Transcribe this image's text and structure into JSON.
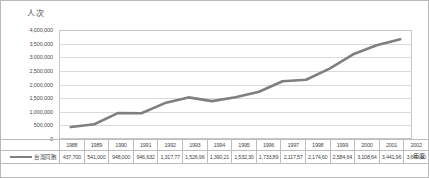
{
  "chart_data": {
    "type": "line",
    "title": "",
    "ylabel": "人次",
    "xlabel": "年度",
    "grid": true,
    "legend_position": "bottom-left",
    "ylim": [
      0,
      4000000
    ],
    "ytick_labels": [
      "4,000,000",
      "3,500,000",
      "3,000,000",
      "2,500,000",
      "2,000,000",
      "1,500,000",
      "1,000,000",
      "500,000",
      "0"
    ],
    "ytick_values": [
      4000000,
      3500000,
      3000000,
      2500000,
      2000000,
      1500000,
      1000000,
      500000,
      0
    ],
    "categories": [
      "1988",
      "1989",
      "1990",
      "1991",
      "1992",
      "1993",
      "1994",
      "1995",
      "1996",
      "1997",
      "1998",
      "1999",
      "2000",
      "2001",
      "2002"
    ],
    "series": [
      {
        "name": "台灣同胞",
        "color": "#7f7f7f",
        "labels": [
          "437,700",
          "541,000",
          "948,000",
          "946,632",
          "1,317,77",
          "1,526,96",
          "1,390,21",
          "1,532,30",
          "1,733,89",
          "2,117,57",
          "2,174,60",
          "2,584,64",
          "3,108,64",
          "3,441,96",
          "3,660,60"
        ],
        "values": [
          437700,
          541000,
          948000,
          946632,
          1317770,
          1526960,
          1390210,
          1532300,
          1733890,
          2117570,
          2174600,
          2584640,
          3108640,
          3441960,
          3660600
        ]
      }
    ]
  },
  "legend": {
    "label": "台灣同胞"
  },
  "axes": {
    "y_caption": "人次",
    "x_caption": "年度"
  }
}
